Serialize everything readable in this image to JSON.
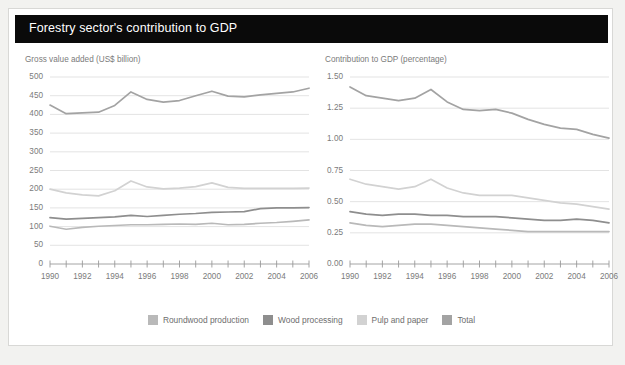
{
  "header": {
    "title": "Forestry sector's contribution to GDP"
  },
  "legend": {
    "items": [
      {
        "label": "Roundwood production",
        "color": "#b9b9b9",
        "swatch_icon": "legend-swatch"
      },
      {
        "label": "Wood processing",
        "color": "#8e8e8e",
        "swatch_icon": "legend-swatch"
      },
      {
        "label": "Pulp and paper",
        "color": "#d2d2d2",
        "swatch_icon": "legend-swatch"
      },
      {
        "label": "Total",
        "color": "#a3a3a3",
        "swatch_icon": "legend-swatch"
      }
    ]
  },
  "panels": {
    "left": {
      "axis_title": "Gross value added (US$ billion)"
    },
    "right": {
      "axis_title": "Contribution to GDP (percentage)"
    }
  },
  "chart_data": [
    {
      "type": "line",
      "title": "Gross value added (US$ billion)",
      "xlabel": "",
      "ylabel": "Gross value added (US$ billion)",
      "x": [
        1990,
        1991,
        1992,
        1993,
        1994,
        1995,
        1996,
        1997,
        1998,
        1999,
        2000,
        2001,
        2002,
        2003,
        2004,
        2005,
        2006
      ],
      "xlim": [
        1990,
        2006
      ],
      "ylim": [
        0,
        500
      ],
      "yticks": [
        0,
        50,
        100,
        150,
        200,
        250,
        300,
        350,
        400,
        450,
        500
      ],
      "xticks_labeled": [
        1990,
        1992,
        1994,
        1996,
        1998,
        2000,
        2002,
        2004,
        2006
      ],
      "grid": true,
      "legend_position": "bottom",
      "series": [
        {
          "name": "Total",
          "color": "#a3a3a3",
          "values": [
            425,
            402,
            404,
            406,
            424,
            460,
            440,
            433,
            437,
            450,
            462,
            449,
            447,
            452,
            456,
            460,
            470
          ]
        },
        {
          "name": "Pulp and paper",
          "color": "#d2d2d2",
          "values": [
            200,
            190,
            185,
            182,
            196,
            222,
            206,
            201,
            203,
            207,
            217,
            205,
            202,
            202,
            202,
            202,
            203
          ]
        },
        {
          "name": "Wood processing",
          "color": "#8e8e8e",
          "values": [
            124,
            120,
            122,
            124,
            126,
            130,
            127,
            130,
            133,
            135,
            138,
            139,
            140,
            148,
            150,
            150,
            151
          ]
        },
        {
          "name": "Roundwood production",
          "color": "#b9b9b9",
          "values": [
            101,
            93,
            98,
            101,
            103,
            105,
            105,
            106,
            107,
            106,
            109,
            105,
            106,
            109,
            111,
            114,
            118
          ]
        }
      ]
    },
    {
      "type": "line",
      "title": "Contribution to GDP (percentage)",
      "xlabel": "",
      "ylabel": "Contribution to GDP (percentage)",
      "x": [
        1990,
        1991,
        1992,
        1993,
        1994,
        1995,
        1996,
        1997,
        1998,
        1999,
        2000,
        2001,
        2002,
        2003,
        2004,
        2005,
        2006
      ],
      "xlim": [
        1990,
        2006
      ],
      "ylim": [
        0.0,
        1.5
      ],
      "yticks": [
        0.0,
        0.25,
        0.5,
        0.75,
        1.0,
        1.25,
        1.5
      ],
      "ytick_labels": [
        "0.00",
        "0.25",
        "0.50",
        "0.75",
        "1.00",
        "1.25",
        "1.50"
      ],
      "xticks_labeled": [
        1990,
        1992,
        1994,
        1996,
        1998,
        2000,
        2002,
        2004,
        2006
      ],
      "grid": true,
      "legend_position": "bottom",
      "series": [
        {
          "name": "Total",
          "color": "#a3a3a3",
          "values": [
            1.42,
            1.35,
            1.33,
            1.31,
            1.33,
            1.4,
            1.3,
            1.24,
            1.23,
            1.24,
            1.21,
            1.16,
            1.12,
            1.09,
            1.08,
            1.04,
            1.01
          ]
        },
        {
          "name": "Pulp and paper",
          "color": "#d2d2d2",
          "values": [
            0.68,
            0.64,
            0.62,
            0.6,
            0.62,
            0.68,
            0.61,
            0.57,
            0.55,
            0.55,
            0.55,
            0.53,
            0.51,
            0.49,
            0.48,
            0.46,
            0.44
          ]
        },
        {
          "name": "Wood processing",
          "color": "#8e8e8e",
          "values": [
            0.42,
            0.4,
            0.39,
            0.4,
            0.4,
            0.39,
            0.39,
            0.38,
            0.38,
            0.38,
            0.37,
            0.36,
            0.35,
            0.35,
            0.36,
            0.35,
            0.33
          ]
        },
        {
          "name": "Roundwood production",
          "color": "#b9b9b9",
          "values": [
            0.33,
            0.31,
            0.3,
            0.31,
            0.32,
            0.32,
            0.31,
            0.3,
            0.29,
            0.28,
            0.27,
            0.26,
            0.26,
            0.26,
            0.26,
            0.26,
            0.26
          ]
        }
      ]
    }
  ]
}
